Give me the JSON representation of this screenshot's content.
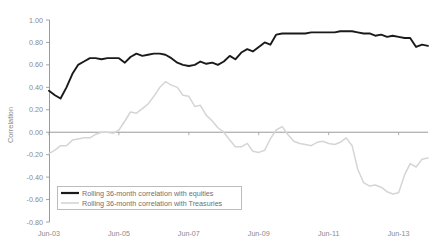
{
  "chart_data": {
    "type": "line",
    "title": "",
    "subtitle": "",
    "xlabel": "",
    "ylabel": "Correlation",
    "ylim": [
      -0.8,
      1.0
    ],
    "ytick_step": 0.2,
    "yticks": [
      "1.00",
      "0.80",
      "0.60",
      "0.40",
      "0.20",
      "0.00",
      "-0.20",
      "-0.40",
      "-0.60",
      "-0.80"
    ],
    "ytick_values": [
      1.0,
      0.8,
      0.6,
      0.4,
      0.2,
      0.0,
      -0.2,
      -0.4,
      -0.6,
      -0.8
    ],
    "xticks": [
      "Jun-03",
      "Jun-05",
      "Jun-07",
      "Jun-09",
      "Jun-11",
      "Jun-13"
    ],
    "xtick_values": [
      2003.46,
      2005.46,
      2007.46,
      2009.46,
      2011.46,
      2013.46
    ],
    "xlim": [
      2003.46,
      2014.3
    ],
    "grid": false,
    "zero_line": true,
    "legend_position": "bottom-left",
    "legend": [
      {
        "name": "Rolling 36-month correlation with equities",
        "color": "#1a1a1a"
      },
      {
        "name": "Rolling 36-month correlation with Treasuries",
        "color": "#d5d5d5"
      }
    ],
    "series": [
      {
        "name": "Rolling 36-month correlation with equities",
        "color": "#1a1a1a",
        "width": 1.9,
        "x": [
          2003.46,
          2003.63,
          2003.79,
          2003.96,
          2004.13,
          2004.29,
          2004.46,
          2004.63,
          2004.79,
          2004.96,
          2005.13,
          2005.29,
          2005.46,
          2005.63,
          2005.79,
          2005.96,
          2006.13,
          2006.29,
          2006.46,
          2006.63,
          2006.79,
          2006.96,
          2007.13,
          2007.29,
          2007.46,
          2007.63,
          2007.79,
          2007.96,
          2008.13,
          2008.29,
          2008.46,
          2008.63,
          2008.79,
          2008.96,
          2009.13,
          2009.29,
          2009.46,
          2009.63,
          2009.79,
          2009.96,
          2010.13,
          2010.29,
          2010.46,
          2010.63,
          2010.79,
          2010.96,
          2011.13,
          2011.29,
          2011.46,
          2011.63,
          2011.79,
          2011.96,
          2012.13,
          2012.29,
          2012.46,
          2012.63,
          2012.79,
          2012.96,
          2013.13,
          2013.29,
          2013.46,
          2013.63,
          2013.79,
          2013.96,
          2014.13,
          2014.3
        ],
        "values": [
          0.37,
          0.33,
          0.3,
          0.4,
          0.52,
          0.6,
          0.63,
          0.66,
          0.66,
          0.65,
          0.66,
          0.66,
          0.66,
          0.62,
          0.67,
          0.7,
          0.68,
          0.69,
          0.7,
          0.7,
          0.69,
          0.66,
          0.62,
          0.6,
          0.59,
          0.6,
          0.63,
          0.61,
          0.62,
          0.6,
          0.63,
          0.68,
          0.65,
          0.71,
          0.74,
          0.72,
          0.76,
          0.8,
          0.78,
          0.87,
          0.88,
          0.88,
          0.88,
          0.88,
          0.88,
          0.89,
          0.89,
          0.89,
          0.89,
          0.89,
          0.9,
          0.9,
          0.9,
          0.89,
          0.88,
          0.88,
          0.86,
          0.87,
          0.85,
          0.86,
          0.85,
          0.84,
          0.84,
          0.76,
          0.78,
          0.77
        ],
        "annotations": [
          {
            "label": "start",
            "x": 2003.46,
            "y": 0.37
          },
          {
            "label": "early-trough",
            "x": 2003.79,
            "y": 0.3
          },
          {
            "label": "mid-plateau",
            "x": 2006.46,
            "y": 0.7
          },
          {
            "label": "2007-dip",
            "x": 2007.46,
            "y": 0.59
          },
          {
            "label": "peak",
            "x": 2011.79,
            "y": 0.9
          },
          {
            "label": "end",
            "x": 2014.3,
            "y": 0.77
          }
        ]
      },
      {
        "name": "Rolling 36-month correlation with Treasuries",
        "color": "#d5d5d5",
        "width": 1.5,
        "x": [
          2003.46,
          2003.63,
          2003.79,
          2003.96,
          2004.13,
          2004.29,
          2004.46,
          2004.63,
          2004.79,
          2004.96,
          2005.13,
          2005.29,
          2005.46,
          2005.63,
          2005.79,
          2005.96,
          2006.13,
          2006.29,
          2006.46,
          2006.63,
          2006.79,
          2006.96,
          2007.13,
          2007.29,
          2007.46,
          2007.63,
          2007.79,
          2007.96,
          2008.13,
          2008.29,
          2008.46,
          2008.63,
          2008.79,
          2008.96,
          2009.13,
          2009.29,
          2009.46,
          2009.63,
          2009.79,
          2009.96,
          2010.13,
          2010.29,
          2010.46,
          2010.63,
          2010.79,
          2010.96,
          2011.13,
          2011.29,
          2011.46,
          2011.63,
          2011.79,
          2011.96,
          2012.13,
          2012.29,
          2012.46,
          2012.63,
          2012.79,
          2012.96,
          2013.13,
          2013.29,
          2013.46,
          2013.63,
          2013.79,
          2013.96,
          2014.13,
          2014.3
        ],
        "values": [
          -0.19,
          -0.16,
          -0.12,
          -0.12,
          -0.07,
          -0.06,
          -0.05,
          -0.05,
          -0.02,
          0.0,
          0.0,
          -0.01,
          0.02,
          0.1,
          0.18,
          0.17,
          0.21,
          0.25,
          0.32,
          0.4,
          0.45,
          0.42,
          0.4,
          0.33,
          0.32,
          0.23,
          0.24,
          0.15,
          0.1,
          0.04,
          0.0,
          -0.07,
          -0.13,
          -0.13,
          -0.1,
          -0.17,
          -0.18,
          -0.16,
          -0.06,
          0.02,
          0.05,
          -0.02,
          -0.08,
          -0.1,
          -0.11,
          -0.12,
          -0.09,
          -0.08,
          -0.1,
          -0.11,
          -0.09,
          -0.05,
          -0.12,
          -0.33,
          -0.45,
          -0.48,
          -0.47,
          -0.49,
          -0.53,
          -0.55,
          -0.54,
          -0.38,
          -0.28,
          -0.31,
          -0.24,
          -0.23
        ],
        "annotations": [
          {
            "label": "start",
            "x": 2003.46,
            "y": -0.19
          },
          {
            "label": "peak",
            "x": 2006.79,
            "y": 0.45
          },
          {
            "label": "2009-trough",
            "x": 2009.46,
            "y": -0.18
          },
          {
            "label": "2010-bump",
            "x": 2010.13,
            "y": 0.05
          },
          {
            "label": "deep-trough",
            "x": 2013.29,
            "y": -0.55
          },
          {
            "label": "end",
            "x": 2014.3,
            "y": -0.23
          }
        ]
      }
    ]
  },
  "plot": {
    "left": 49,
    "top": 20,
    "right": 428,
    "bottom": 222,
    "axis_color": "#9a9a9a",
    "zero_line_color": "#8f8f8f",
    "background": "#ffffff"
  },
  "legend_box": {
    "x": 57,
    "y": 186,
    "width": 184,
    "height": 23,
    "border_color": "#b5b5b5"
  }
}
